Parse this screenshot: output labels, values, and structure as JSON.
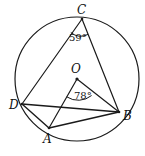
{
  "figure": {
    "kind": "circle-geometry-diagram",
    "width": 145,
    "height": 156,
    "background_color": "#ffffff",
    "stroke_color": "#1a1a1a",
    "text_color": "#111111"
  },
  "circle": {
    "name": "circumscribed-circle",
    "center_label": "O",
    "center_x": 77,
    "center_y": 79,
    "radius": 62
  },
  "points": [
    {
      "id": "C",
      "label": "C",
      "x": 82,
      "y": 19,
      "position": "top"
    },
    {
      "id": "O",
      "label": "O",
      "x": 77,
      "y": 79,
      "position": "center"
    },
    {
      "id": "D",
      "label": "D",
      "x": 22,
      "y": 104,
      "position": "left"
    },
    {
      "id": "B",
      "label": "B",
      "x": 119,
      "y": 112,
      "position": "right"
    },
    {
      "id": "A",
      "label": "A",
      "x": 49,
      "y": 128,
      "position": "bottom-left"
    }
  ],
  "segments": [
    {
      "name": "segment-CD",
      "from": "C",
      "to": "D"
    },
    {
      "name": "segment-CB",
      "from": "C",
      "to": "B"
    },
    {
      "name": "segment-OA",
      "from": "O",
      "to": "A"
    },
    {
      "name": "segment-OB",
      "from": "O",
      "to": "B"
    },
    {
      "name": "segment-DB",
      "from": "D",
      "to": "B"
    },
    {
      "name": "segment-DA",
      "from": "D",
      "to": "A"
    },
    {
      "name": "segment-AB",
      "from": "A",
      "to": "B"
    }
  ],
  "angles": [
    {
      "id": "angle-at-C",
      "vertex": "C",
      "label": "59°",
      "value": 59,
      "unit": "degrees",
      "type": "inscribed-angle",
      "rays": [
        "C-D",
        "C-B"
      ]
    },
    {
      "id": "angle-at-O",
      "vertex": "O",
      "label": "78°",
      "value": 78,
      "unit": "degrees",
      "type": "central-angle",
      "rays": [
        "O-A",
        "O-B"
      ]
    }
  ]
}
